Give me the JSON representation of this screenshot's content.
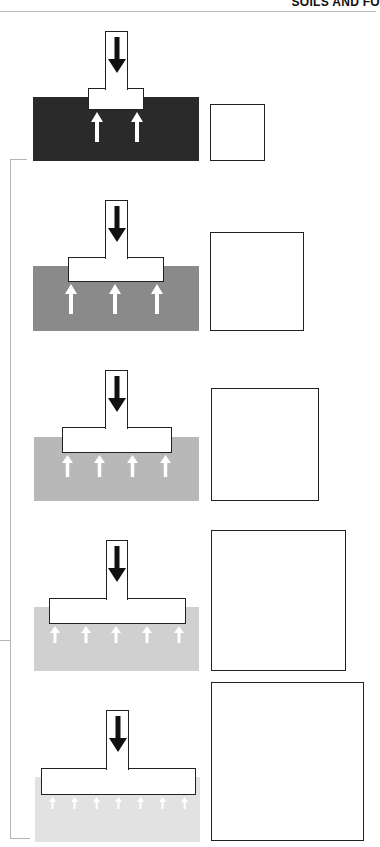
{
  "header": {
    "title": "SOILS AND FO"
  },
  "colors": {
    "outline": "#222222",
    "bracket": "#b5b5b5",
    "load_arrow": "#111111",
    "reaction_arrow": "#ffffff"
  },
  "panels": [
    {
      "id": 1,
      "soil_color": "#2a2a2a",
      "column": {
        "x": 105,
        "y": 31,
        "w": 23,
        "h": 58
      },
      "footing": {
        "x": 88,
        "y": 88,
        "w": 56,
        "h": 22
      },
      "soil": {
        "x": 33,
        "y": 97,
        "w": 166,
        "h": 64
      },
      "square": {
        "x": 210,
        "y": 104,
        "w": 55,
        "h": 57
      },
      "reaction_arrows": 2,
      "reaction_arrow_x": [
        97,
        137
      ],
      "reaction_arrow_size": "large"
    },
    {
      "id": 2,
      "soil_color": "#8a8a8a",
      "column": {
        "x": 105,
        "y": 200,
        "w": 23,
        "h": 58
      },
      "footing": {
        "x": 68,
        "y": 257,
        "w": 96,
        "h": 25
      },
      "soil": {
        "x": 33,
        "y": 266,
        "w": 166,
        "h": 65
      },
      "square": {
        "x": 210,
        "y": 232,
        "w": 94,
        "h": 99
      },
      "reaction_arrows": 3,
      "reaction_arrow_x": [
        71,
        115,
        157
      ],
      "reaction_arrow_size": "large"
    },
    {
      "id": 3,
      "soil_color": "#b8b8b8",
      "column": {
        "x": 105,
        "y": 370,
        "w": 23,
        "h": 58
      },
      "footing": {
        "x": 62,
        "y": 427,
        "w": 110,
        "h": 26
      },
      "soil": {
        "x": 34,
        "y": 437,
        "w": 165,
        "h": 64
      },
      "square": {
        "x": 211,
        "y": 388,
        "w": 108,
        "h": 113
      },
      "reaction_arrows": 4,
      "reaction_arrow_x": [
        67,
        99,
        132,
        165
      ],
      "reaction_arrow_size": "medium"
    },
    {
      "id": 4,
      "soil_color": "#d0d0d0",
      "column": {
        "x": 106,
        "y": 540,
        "w": 22,
        "h": 59
      },
      "footing": {
        "x": 49,
        "y": 598,
        "w": 137,
        "h": 26
      },
      "soil": {
        "x": 34,
        "y": 607,
        "w": 165,
        "h": 64
      },
      "square": {
        "x": 211,
        "y": 530,
        "w": 135,
        "h": 141
      },
      "reaction_arrows": 5,
      "reaction_arrow_x": [
        55,
        86,
        116,
        147,
        179
      ],
      "reaction_arrow_size": "small"
    },
    {
      "id": 5,
      "soil_color": "#e2e2e2",
      "column": {
        "x": 106,
        "y": 710,
        "w": 23,
        "h": 59
      },
      "footing": {
        "x": 41,
        "y": 768,
        "w": 155,
        "h": 27
      },
      "soil": {
        "x": 35,
        "y": 777,
        "w": 165,
        "h": 65
      },
      "square": {
        "x": 211,
        "y": 682,
        "w": 153,
        "h": 159
      },
      "reaction_arrows": 7,
      "reaction_arrow_x": [
        52,
        74,
        96,
        118,
        140,
        162,
        184
      ],
      "reaction_arrow_size": "tiny"
    }
  ],
  "bracket": {
    "x": 10,
    "top": 159,
    "bottom": 838,
    "ticks": [
      {
        "y": 159,
        "x1": 10,
        "x2": 27
      },
      {
        "y": 640,
        "x1": 0,
        "x2": 10
      },
      {
        "y": 838,
        "x1": 10,
        "x2": 30
      }
    ]
  }
}
